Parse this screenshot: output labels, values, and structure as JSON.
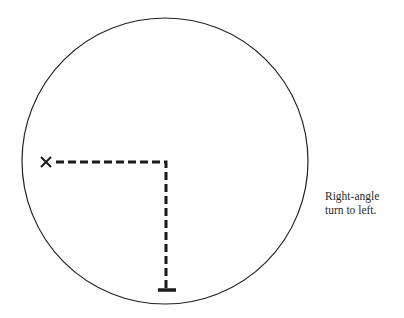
{
  "diagram": {
    "type": "path-in-circle",
    "circle": {
      "cx": 165,
      "cy": 161,
      "r": 143
    },
    "start_marker": {
      "symbol": "x-mark",
      "x": 46,
      "y": 162
    },
    "path": {
      "style": "dashed",
      "segments": [
        {
          "from": [
            56,
            162
          ],
          "to": [
            166,
            162
          ],
          "direction": "horizontal"
        },
        {
          "from": [
            166,
            162
          ],
          "to": [
            166,
            289
          ],
          "direction": "vertical"
        }
      ]
    },
    "end_marker": {
      "symbol": "base-bar",
      "x": 166,
      "y": 290
    },
    "colors": {
      "stroke": "#1a1a1a",
      "circle": "#222222",
      "background": "#ffffff"
    }
  },
  "caption": {
    "line1": "Right-angle",
    "line2": "turn to left."
  }
}
